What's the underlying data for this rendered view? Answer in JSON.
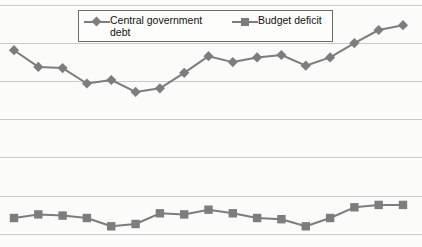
{
  "chart_data": {
    "type": "line",
    "title": "",
    "subtitle": "",
    "xlabel": "",
    "ylabel": "",
    "grid": true,
    "gridlines": 7,
    "legend_position": "top-center",
    "x": [
      1,
      2,
      3,
      4,
      5,
      6,
      7,
      8,
      9,
      10,
      11,
      12,
      13,
      14,
      15,
      16,
      17
    ],
    "ylim": [
      0,
      100
    ],
    "series": [
      {
        "name": "Central government debt",
        "marker": "diamond",
        "color": "#7d7d7d",
        "values": [
          81,
          74,
          73.5,
          67,
          68.5,
          63.5,
          65,
          71.5,
          78.5,
          76,
          78,
          79,
          74.5,
          78,
          84,
          89.5,
          91.5
        ]
      },
      {
        "name": "Budget deficit",
        "marker": "square",
        "color": "#7d7d7d",
        "values": [
          10.5,
          12,
          11.5,
          10.5,
          7,
          8,
          12.5,
          12,
          14,
          12.5,
          10.5,
          10,
          7,
          10.5,
          15,
          16,
          16
        ]
      }
    ]
  },
  "legend": {
    "entries": [
      {
        "label": "Central government debt",
        "marker": "diamond-marker-icon"
      },
      {
        "label": "Budget deficit",
        "marker": "square-marker-icon"
      }
    ]
  },
  "colors": {
    "series": "#7d7d7d",
    "gridline": "#c9c9c9",
    "background": "#fbfbfa",
    "legend_border": "#6b6b6b",
    "text": "#111111"
  }
}
